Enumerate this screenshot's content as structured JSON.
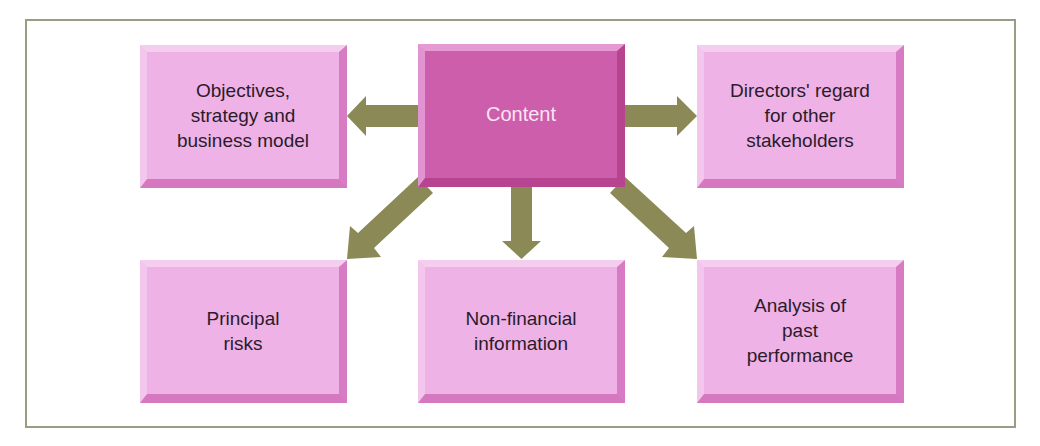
{
  "diagram": {
    "center": {
      "label": "Content"
    },
    "nodes": [
      {
        "id": "objectives",
        "label": "Objectives,\nstrategy and\nbusiness model"
      },
      {
        "id": "directors",
        "label": "Directors' regard\nfor other\nstakeholders"
      },
      {
        "id": "risks",
        "label": "Principal\nrisks"
      },
      {
        "id": "nonfinancial",
        "label": "Non-financial\ninformation"
      },
      {
        "id": "performance",
        "label": "Analysis of\npast\nperformance"
      }
    ],
    "edges": [
      {
        "from": "Content",
        "to": "Objectives, strategy and business model"
      },
      {
        "from": "Content",
        "to": "Directors' regard for other stakeholders"
      },
      {
        "from": "Content",
        "to": "Principal risks"
      },
      {
        "from": "Content",
        "to": "Non-financial information"
      },
      {
        "from": "Content",
        "to": "Analysis of past performance"
      }
    ],
    "colors": {
      "node_fill": "#eeb2e6",
      "center_fill": "#cd5eac",
      "arrow": "#8b8a57",
      "frame": "#9c9c82"
    }
  }
}
